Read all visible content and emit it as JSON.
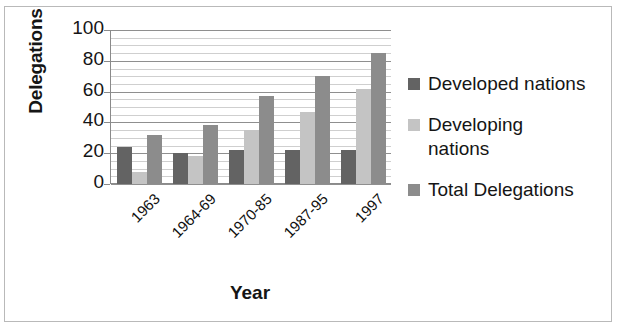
{
  "chart_data": {
    "type": "bar",
    "title": "",
    "xlabel": "Year",
    "ylabel": "Delegations",
    "categories": [
      "1963",
      "1964-69",
      "1970-85",
      "1987-95",
      "1997"
    ],
    "series": [
      {
        "name": "Developed nations",
        "color": "#636363",
        "values": [
          24,
          20,
          22,
          22,
          22
        ]
      },
      {
        "name": "Developing nations",
        "color": "#c4c4c4",
        "values": [
          8,
          18,
          35,
          47,
          62
        ]
      },
      {
        "name": "Total Delegations",
        "color": "#8c8c8c",
        "values": [
          32,
          38,
          57,
          70,
          85
        ]
      }
    ],
    "ylim": [
      0,
      100
    ],
    "yticks": [
      0,
      20,
      40,
      60,
      80,
      100
    ],
    "ytick_labels": [
      "0",
      "20",
      "40",
      "60",
      "80",
      "100"
    ],
    "grid": true,
    "grid_minor_step": 5,
    "grid_major_step": 20,
    "legend_position": "right",
    "xtick_rotation": -45
  },
  "legend": {
    "entries": [
      {
        "label": "Developed nations",
        "color": "#636363"
      },
      {
        "label": "Developing nations",
        "color": "#c4c4c4"
      },
      {
        "label": "Total Delegations",
        "color": "#8c8c8c"
      }
    ]
  }
}
